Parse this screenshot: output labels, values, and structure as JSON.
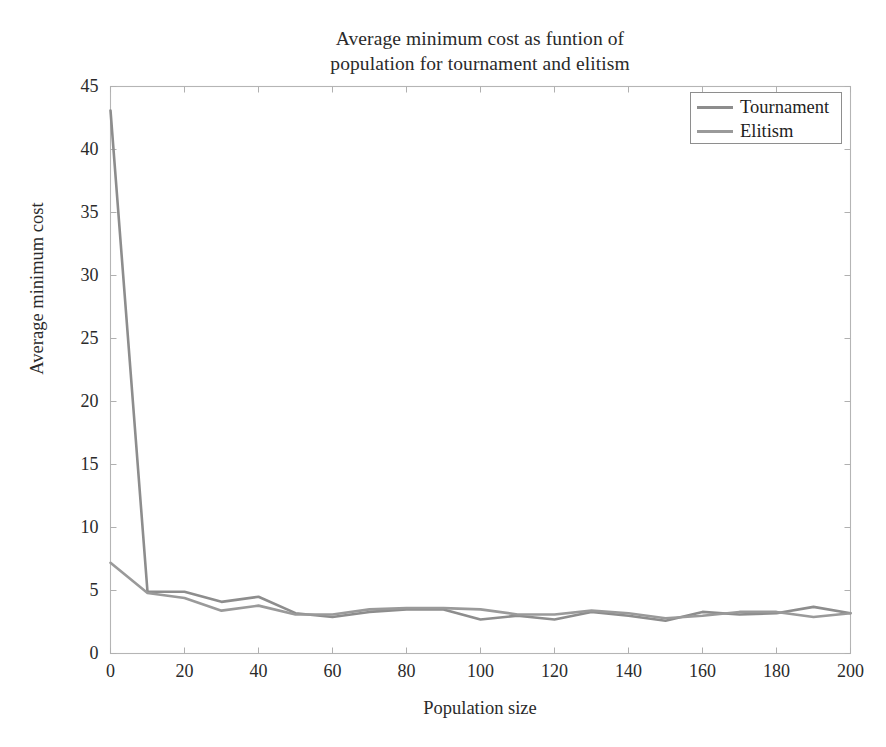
{
  "figure": {
    "width": 886,
    "height": 747,
    "background": "#ffffff",
    "frame_color": "#b5b5b5",
    "tick_color": "#b0b0b0",
    "grid": false
  },
  "title": {
    "line1": "Average minimum cost as funtion of",
    "line2": "population for tournament and elitism"
  },
  "axes": {
    "xlabel": "Population size",
    "ylabel": "Average minimum cost",
    "xticks": [
      0,
      20,
      40,
      60,
      80,
      100,
      120,
      140,
      160,
      180,
      200
    ],
    "yticks": [
      0,
      5,
      10,
      15,
      20,
      25,
      30,
      35,
      40,
      45
    ],
    "xlim": [
      0,
      200
    ],
    "ylim": [
      0,
      45
    ]
  },
  "legend": {
    "position": "top-right",
    "entries": [
      {
        "label": "Tournament",
        "color": "#8d8d8d"
      },
      {
        "label": "Elitism",
        "color": "#9a9a9a"
      }
    ]
  },
  "chart_data": {
    "type": "line",
    "title": "Average minimum cost as funtion of population for tournament and elitism",
    "xlabel": "Population size",
    "ylabel": "Average minimum cost",
    "xlim": [
      0,
      200
    ],
    "ylim": [
      0,
      45
    ],
    "xticks": [
      0,
      20,
      40,
      60,
      80,
      100,
      120,
      140,
      160,
      180,
      200
    ],
    "yticks": [
      0,
      5,
      10,
      15,
      20,
      25,
      30,
      35,
      40,
      45
    ],
    "grid": false,
    "legend_position": "top-right",
    "x": [
      0,
      10,
      20,
      30,
      40,
      50,
      60,
      70,
      80,
      90,
      100,
      110,
      120,
      130,
      140,
      150,
      160,
      170,
      180,
      190,
      200
    ],
    "series": [
      {
        "name": "Tournament",
        "color": "#8d8d8d",
        "values": [
          43.1,
          4.9,
          4.9,
          4.1,
          4.5,
          3.2,
          2.9,
          3.3,
          3.5,
          3.5,
          2.7,
          3.0,
          2.7,
          3.3,
          3.0,
          2.6,
          3.3,
          3.1,
          3.2,
          3.7,
          3.2
        ]
      },
      {
        "name": "Elitism",
        "color": "#9a9a9a",
        "values": [
          7.2,
          4.8,
          4.4,
          3.4,
          3.8,
          3.1,
          3.1,
          3.5,
          3.6,
          3.6,
          3.5,
          3.1,
          3.1,
          3.4,
          3.2,
          2.8,
          3.0,
          3.3,
          3.3,
          2.9,
          3.2
        ]
      }
    ]
  }
}
